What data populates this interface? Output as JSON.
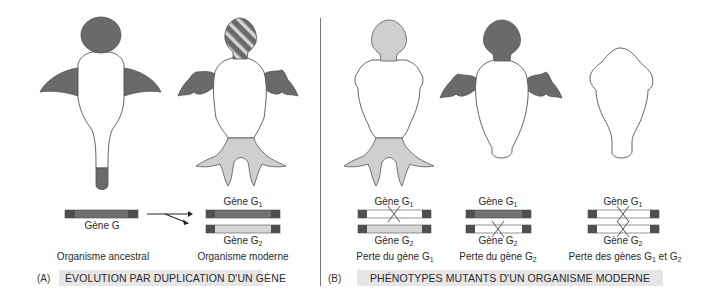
{
  "colors": {
    "dark_gray": "#6a6a6a",
    "light_gray": "#cfcfcf",
    "stripe_light": "#d4d4d4",
    "outline": "#555555",
    "caption_bg": "#e6e6e6",
    "gene_cap": "#4f4f4f",
    "divider": "#777777"
  },
  "panel_a": {
    "tag": "(A)",
    "caption": "ÉVOLUTION PAR DUPLICATION D'UN GÈNE",
    "ancestral": {
      "label": "Organisme ancestral",
      "gene_label": "Gène G"
    },
    "modern": {
      "label": "Organisme moderne",
      "gene1_label": "Gène G",
      "gene1_sub": "1",
      "gene2_label": "Gène G",
      "gene2_sub": "2"
    },
    "arrow": "duplication-arrow"
  },
  "panel_b": {
    "tag": "(B)",
    "caption": "PHÉNOTYPES MUTANTS D'UN ORGANISME MODERNE",
    "mutants": [
      {
        "gene1_label": "Gène G",
        "gene1_sub": "1",
        "gene1_lost": true,
        "gene2_label": "Gène G",
        "gene2_sub": "2",
        "gene2_lost": false,
        "label_prefix": "Perte du gène G",
        "label_sub": "1",
        "label_suffix": ""
      },
      {
        "gene1_label": "Gène G",
        "gene1_sub": "1",
        "gene1_lost": false,
        "gene2_label": "Gène G",
        "gene2_sub": "2",
        "gene2_lost": true,
        "label_prefix": "Perte du gène G",
        "label_sub": "2",
        "label_suffix": ""
      },
      {
        "gene1_label": "Gène G",
        "gene1_sub": "1",
        "gene1_lost": true,
        "gene2_label": "Gène G",
        "gene2_sub": "2",
        "gene2_lost": true,
        "label_prefix": "Perte des gènes G",
        "label_sub": "1",
        "label_mid": " et G",
        "label_sub2": "2"
      }
    ]
  }
}
